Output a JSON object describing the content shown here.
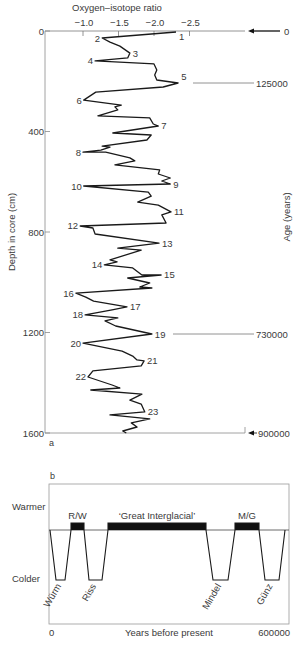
{
  "chart_data": [
    {
      "id": "a",
      "panel_label": "a",
      "type": "line",
      "title": "Oxygen–isotope ratio",
      "xlabel": "Oxygen–isotope ratio",
      "ylabel": "Depth in core (cm)",
      "y2label": "Age (years)",
      "x_ticks": [
        "−1.0",
        "−1.5",
        "−2.0",
        "−2.5"
      ],
      "x_tick_values": [
        -1.0,
        -1.5,
        -2.0,
        -2.5
      ],
      "y_ticks": [
        "0",
        "400",
        "800",
        "1200",
        "1600"
      ],
      "y_tick_values": [
        0,
        400,
        800,
        1200,
        1600
      ],
      "ylim": [
        0,
        1600
      ],
      "y_inverted": true,
      "grid": false,
      "age_markers": [
        {
          "label": "0",
          "depth": 0,
          "arrow": true
        },
        {
          "label": "125000",
          "depth": 207,
          "arrow": false
        },
        {
          "label": "730000",
          "depth": 1206,
          "arrow": false
        },
        {
          "label": "900000",
          "depth": 1600,
          "arrow": true
        }
      ],
      "stage_labels": [
        {
          "n": "1",
          "iso": -2.31,
          "depth": 4
        },
        {
          "n": "2",
          "iso": -1.27,
          "depth": 28
        },
        {
          "n": "3",
          "iso": -1.66,
          "depth": 88
        },
        {
          "n": "4",
          "iso": -1.17,
          "depth": 119
        },
        {
          "n": "5",
          "iso": -2.34,
          "depth": 207
        },
        {
          "n": "6",
          "iso": -1.01,
          "depth": 275
        },
        {
          "n": "7",
          "iso": -2.06,
          "depth": 378
        },
        {
          "n": "8",
          "iso": -1.0,
          "depth": 482
        },
        {
          "n": "9",
          "iso": -2.23,
          "depth": 609
        },
        {
          "n": "10",
          "iso": -1.01,
          "depth": 617
        },
        {
          "n": "11",
          "iso": -2.24,
          "depth": 720
        },
        {
          "n": "12",
          "iso": -0.96,
          "depth": 776
        },
        {
          "n": "13",
          "iso": -2.07,
          "depth": 844
        },
        {
          "n": "14",
          "iso": -1.3,
          "depth": 931
        },
        {
          "n": "15",
          "iso": -2.1,
          "depth": 971
        },
        {
          "n": "16",
          "iso": -0.9,
          "depth": 1043
        },
        {
          "n": "17",
          "iso": -1.62,
          "depth": 1098
        },
        {
          "n": "18",
          "iso": -1.03,
          "depth": 1130
        },
        {
          "n": "19",
          "iso": -1.97,
          "depth": 1206
        },
        {
          "n": "20",
          "iso": -1.0,
          "depth": 1242
        },
        {
          "n": "21",
          "iso": -1.86,
          "depth": 1313
        },
        {
          "n": "22",
          "iso": -1.07,
          "depth": 1377
        },
        {
          "n": "23",
          "iso": -1.87,
          "depth": 1516
        }
      ],
      "series": [
        {
          "name": "Oxygen-isotope ratio vs depth",
          "points": [
            [
              -2.31,
              4
            ],
            [
              -1.27,
              28
            ],
            [
              -1.38,
              44
            ],
            [
              -1.52,
              60
            ],
            [
              -1.66,
              88
            ],
            [
              -1.63,
              107
            ],
            [
              -1.17,
              119
            ],
            [
              -2.0,
              131
            ],
            [
              -2.04,
              155
            ],
            [
              -2.01,
              175
            ],
            [
              -2.04,
              195
            ],
            [
              -2.34,
              207
            ],
            [
              -2.13,
              223
            ],
            [
              -1.18,
              243
            ],
            [
              -1.01,
              275
            ],
            [
              -1.54,
              295
            ],
            [
              -1.45,
              302
            ],
            [
              -1.49,
              314
            ],
            [
              -1.21,
              338
            ],
            [
              -1.94,
              346
            ],
            [
              -1.99,
              370
            ],
            [
              -2.06,
              378
            ],
            [
              -1.42,
              406
            ],
            [
              -1.96,
              414
            ],
            [
              -1.9,
              434
            ],
            [
              -1.27,
              458
            ],
            [
              -1.38,
              462
            ],
            [
              -1.25,
              474
            ],
            [
              -1.0,
              482
            ],
            [
              -1.32,
              482
            ],
            [
              -1.66,
              505
            ],
            [
              -1.73,
              517
            ],
            [
              -1.45,
              533
            ],
            [
              -2.08,
              553
            ],
            [
              -2.06,
              569
            ],
            [
              -2.23,
              585
            ],
            [
              -2.11,
              597
            ],
            [
              -2.23,
              609
            ],
            [
              -1.01,
              617
            ],
            [
              -1.92,
              641
            ],
            [
              -1.96,
              657
            ],
            [
              -1.77,
              681
            ],
            [
              -2.06,
              693
            ],
            [
              -2.24,
              720
            ],
            [
              -2.11,
              732
            ],
            [
              -2.17,
              764
            ],
            [
              -0.96,
              776
            ],
            [
              -1.14,
              784
            ],
            [
              -1.17,
              808
            ],
            [
              -2.07,
              844
            ],
            [
              -1.49,
              864
            ],
            [
              -1.82,
              872
            ],
            [
              -1.38,
              911
            ],
            [
              -1.48,
              919
            ],
            [
              -1.3,
              931
            ],
            [
              -1.7,
              943
            ],
            [
              -1.83,
              971
            ],
            [
              -2.1,
              971
            ],
            [
              -1.63,
              983
            ],
            [
              -1.94,
              1003
            ],
            [
              -1.8,
              1019
            ],
            [
              -1.97,
              1023
            ],
            [
              -0.9,
              1043
            ],
            [
              -1.04,
              1059
            ],
            [
              -1.15,
              1075
            ],
            [
              -1.62,
              1098
            ],
            [
              -1.41,
              1110
            ],
            [
              -1.03,
              1130
            ],
            [
              -1.49,
              1142
            ],
            [
              -1.31,
              1154
            ],
            [
              -1.46,
              1174
            ],
            [
              -1.97,
              1206
            ],
            [
              -1.0,
              1242
            ],
            [
              -1.55,
              1274
            ],
            [
              -1.7,
              1294
            ],
            [
              -1.76,
              1309
            ],
            [
              -1.86,
              1313
            ],
            [
              -1.82,
              1333
            ],
            [
              -1.14,
              1353
            ],
            [
              -1.07,
              1377
            ],
            [
              -1.41,
              1409
            ],
            [
              -1.52,
              1421
            ],
            [
              -1.11,
              1429
            ],
            [
              -1.83,
              1445
            ],
            [
              -1.66,
              1469
            ],
            [
              -1.82,
              1485
            ],
            [
              -1.87,
              1516
            ],
            [
              -1.38,
              1528
            ],
            [
              -1.94,
              1544
            ],
            [
              -1.68,
              1560
            ],
            [
              -1.76,
              1576
            ],
            [
              -1.56,
              1592
            ],
            [
              -1.61,
              1600
            ]
          ]
        }
      ]
    },
    {
      "id": "b",
      "panel_label": "b",
      "type": "line",
      "title": "",
      "xlabel": "Years before present",
      "x_ticks": [
        "0",
        "600000"
      ],
      "xlim": [
        0,
        600000
      ],
      "y_category_labels": {
        "top": "Warmer",
        "bottom": "Colder"
      },
      "grid": false,
      "levels": {
        "warm": 1,
        "neutral": 0,
        "cold": -1
      },
      "series": [
        {
          "name": "Alpine glacial sequence",
          "points": [
            [
              2500,
              0
            ],
            [
              17500,
              -1
            ],
            [
              40000,
              -1
            ],
            [
              55000,
              0
            ],
            [
              55000,
              0.2
            ],
            [
              87500,
              0.2
            ],
            [
              87500,
              0
            ],
            [
              100000,
              -1
            ],
            [
              132500,
              -1
            ],
            [
              147500,
              0
            ],
            [
              147500,
              0.2
            ],
            [
              392500,
              0.2
            ],
            [
              392500,
              0
            ],
            [
              410000,
              -1
            ],
            [
              447500,
              -1
            ],
            [
              465000,
              0
            ],
            [
              465000,
              0.2
            ],
            [
              525000,
              0.2
            ],
            [
              525000,
              0
            ],
            [
              540000,
              -1
            ],
            [
              575000,
              -1
            ],
            [
              590000,
              0
            ]
          ]
        }
      ],
      "warm_blocks": [
        {
          "label": "R/W",
          "start": 55000,
          "end": 87500
        },
        {
          "label": "‘Great Interglacial’",
          "start": 147500,
          "end": 392500
        },
        {
          "label": "M/G",
          "start": 465000,
          "end": 525000
        }
      ],
      "cold_stages": [
        {
          "label": "Würm",
          "center": 28750
        },
        {
          "label": "Riss",
          "center": 116250
        },
        {
          "label": "Mindel",
          "center": 428750
        },
        {
          "label": "Günz",
          "center": 557500
        }
      ]
    }
  ]
}
